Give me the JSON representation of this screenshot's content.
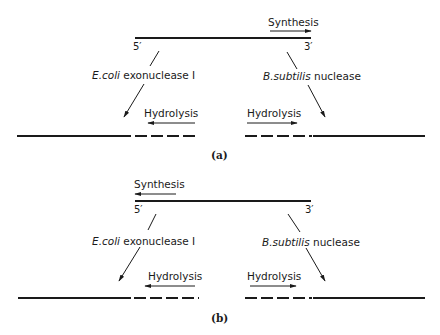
{
  "panels": [
    {
      "caption": "(a)",
      "top_strand": {
        "left_end": "5′",
        "right_end": "3′"
      },
      "synthesis": {
        "label": "Synthesis",
        "direction": "right"
      },
      "left_enzyme": {
        "name_italic": "E.coli",
        "name_rest": "exonuclease I"
      },
      "right_enzyme": {
        "name_italic": "B.subtilis",
        "name_rest": "nuclease"
      },
      "left_hydrolysis": {
        "label": "Hydrolysis",
        "direction": "left"
      },
      "right_hydrolysis": {
        "label": "Hydrolysis",
        "direction": "right"
      }
    },
    {
      "caption": "(b)",
      "top_strand": {
        "left_end": "5′",
        "right_end": "3′"
      },
      "synthesis": {
        "label": "Synthesis",
        "direction": "left"
      },
      "left_enzyme": {
        "name_italic": "E.coli",
        "name_rest": "exonuclease I"
      },
      "right_enzyme": {
        "name_italic": "B.subtilis",
        "name_rest": "nuclease"
      },
      "left_hydrolysis": {
        "label": "Hydrolysis",
        "direction": "left"
      },
      "right_hydrolysis": {
        "label": "Hydrolysis",
        "direction": "right"
      }
    }
  ],
  "colors": {
    "ink": "#1a1a1a",
    "background": "#ffffff"
  }
}
